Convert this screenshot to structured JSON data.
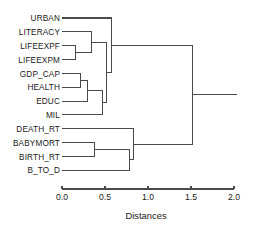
{
  "chart_data": {
    "type": "dendrogram",
    "title": "",
    "xlabel": "Distances",
    "ylabel": "",
    "xlim": [
      0.0,
      2.0
    ],
    "xticks": [
      0.0,
      0.5,
      1.0,
      1.5,
      2.0
    ],
    "xtick_labels": [
      "0.0",
      "0.5",
      "1.0",
      "1.5",
      "2.0"
    ],
    "grid": false,
    "legend": null,
    "orientation": "horizontal-left-to-right",
    "leaves": [
      "URBAN",
      "LITERACY",
      "LIFEEXPF",
      "LIFEEXPM",
      "GDP_CAP",
      "HEALTH",
      "EDUC",
      "MIL",
      "DEATH_RT",
      "BABYMORT",
      "BIRTH_RT",
      "B_TO_D"
    ],
    "merges": [
      {
        "id": "m1",
        "children": [
          "LIFEEXPF",
          "LIFEEXPM"
        ],
        "distance": 0.16
      },
      {
        "id": "m2",
        "children": [
          "GDP_CAP",
          "HEALTH"
        ],
        "distance": 0.21
      },
      {
        "id": "m3",
        "children": [
          "m2",
          "EDUC"
        ],
        "distance": 0.3
      },
      {
        "id": "m4",
        "children": [
          "LITERACY",
          "m1"
        ],
        "distance": 0.34
      },
      {
        "id": "m5",
        "children": [
          "BABYMORT",
          "BIRTH_RT"
        ],
        "distance": 0.38
      },
      {
        "id": "m6",
        "children": [
          "m3",
          "MIL"
        ],
        "distance": 0.47
      },
      {
        "id": "m7",
        "children": [
          "m4",
          "m6"
        ],
        "distance": 0.52
      },
      {
        "id": "m8",
        "children": [
          "URBAN",
          "m7"
        ],
        "distance": 0.58
      },
      {
        "id": "m9",
        "children": [
          "m5",
          "B_TO_D"
        ],
        "distance": 0.79
      },
      {
        "id": "m10",
        "children": [
          "DEATH_RT",
          "m9"
        ],
        "distance": 0.83
      },
      {
        "id": "m11",
        "children": [
          "m8",
          "m10"
        ],
        "distance": 1.52
      }
    ],
    "root_distance": 1.52,
    "colors": {
      "line": "#4a4a4a",
      "text": "#1a1a1a",
      "background": "#ffffff"
    }
  },
  "axis": {
    "title": "Distances",
    "ticks": [
      {
        "value": "0.0",
        "x": 0.0
      },
      {
        "value": "0.5",
        "x": 0.5
      },
      {
        "value": "1.0",
        "x": 1.0
      },
      {
        "value": "1.5",
        "x": 1.5
      },
      {
        "value": "2.0",
        "x": 2.0
      }
    ]
  }
}
